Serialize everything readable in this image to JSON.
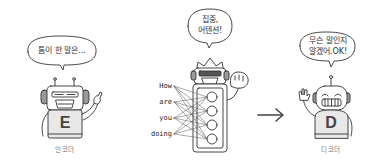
{
  "diagram": {
    "colors": {
      "stroke": "#333333",
      "body_fill": "#e8e8e8",
      "face_fill": "#ffffff",
      "ear_fill": "#9a9a9a",
      "arrow": "#444444",
      "label": "#777777"
    },
    "encoder": {
      "speech": "톰이 한 말은...",
      "chest_letter": "E",
      "label": "인코더"
    },
    "attention": {
      "speech_line1": "집중,",
      "speech_line2": "어텐션!",
      "input_words": [
        "How",
        "are",
        "you",
        "doing"
      ],
      "node_count": 4
    },
    "arrow": {
      "direction": "right"
    },
    "decoder": {
      "speech_line1": "무슨 말인지",
      "speech_line2": "알겠어.OK!",
      "chest_letter": "D",
      "label": "디코더"
    }
  }
}
